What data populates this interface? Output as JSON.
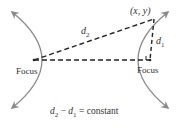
{
  "diagram": {
    "type": "hyperbola-definition",
    "left_focus_label": "Focus",
    "right_focus_label": "Focus",
    "point_label": "(x, y)",
    "d1_label": "d",
    "d1_sub": "1",
    "d2_label": "d",
    "d2_sub": "2",
    "equation": {
      "a": "d",
      "a_sub": "2",
      "minus": " − ",
      "b": "d",
      "b_sub": "1",
      "rhs": " = constant"
    },
    "colors": {
      "curve": "#8a8a8a",
      "dashes": "#222222",
      "text": "#333333"
    }
  }
}
